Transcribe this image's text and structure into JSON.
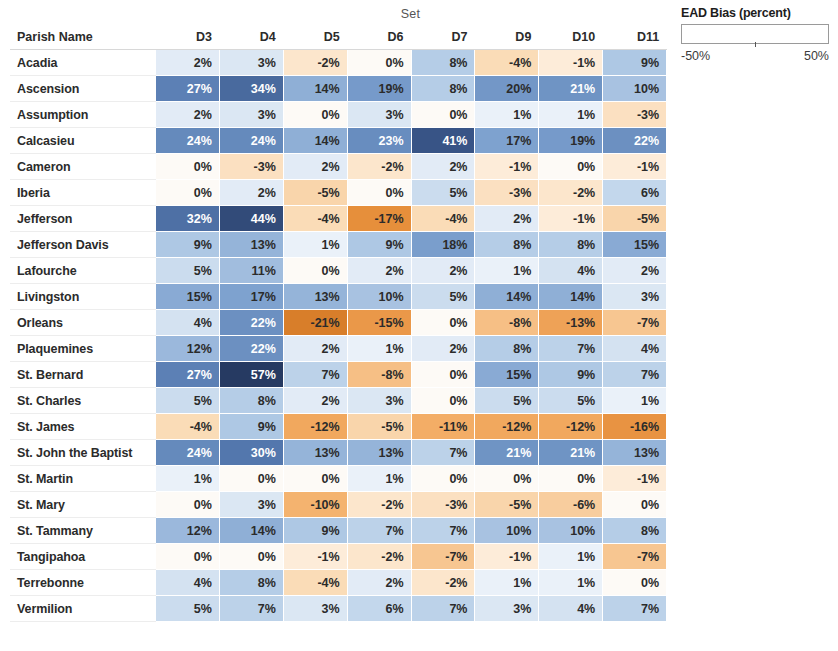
{
  "axis": {
    "column_group_title": "Set",
    "row_header": "Parish Name"
  },
  "legend": {
    "title": "EAD Bias (percent)",
    "min_label": "-50%",
    "max_label": "50%",
    "min_value": -50,
    "max_value": 50,
    "colors": {
      "negative_extreme": "#4a2910",
      "negative_mid": "#f0a75a",
      "neutral": "#fdf6ee",
      "positive_mid": "#7b9fd0",
      "positive_extreme": "#2b4570"
    }
  },
  "chart_data": {
    "type": "heatmap",
    "title": "EAD Bias (percent)",
    "xlabel": "Set",
    "ylabel": "Parish Name",
    "grid": false,
    "legend_position": "top-right",
    "value_suffix": "%",
    "zlim": [
      -50,
      50
    ],
    "categories": [
      "D3",
      "D4",
      "D5",
      "D6",
      "D7",
      "D9",
      "D10",
      "D11"
    ],
    "rows": [
      {
        "label": "Acadia",
        "values": [
          2,
          3,
          -2,
          0,
          8,
          -4,
          -1,
          9
        ]
      },
      {
        "label": "Ascension",
        "values": [
          27,
          34,
          14,
          19,
          8,
          20,
          21,
          10
        ]
      },
      {
        "label": "Assumption",
        "values": [
          2,
          3,
          0,
          3,
          0,
          1,
          1,
          -3
        ]
      },
      {
        "label": "Calcasieu",
        "values": [
          24,
          24,
          14,
          23,
          41,
          17,
          19,
          22
        ]
      },
      {
        "label": "Cameron",
        "values": [
          0,
          -3,
          2,
          -2,
          2,
          -1,
          0,
          -1
        ]
      },
      {
        "label": "Iberia",
        "values": [
          0,
          2,
          -5,
          0,
          5,
          -3,
          -2,
          6
        ]
      },
      {
        "label": "Jefferson",
        "values": [
          32,
          44,
          -4,
          -17,
          -4,
          2,
          -1,
          -5
        ]
      },
      {
        "label": "Jefferson Davis",
        "values": [
          9,
          13,
          1,
          9,
          18,
          8,
          8,
          15
        ]
      },
      {
        "label": "Lafourche",
        "values": [
          5,
          11,
          0,
          2,
          2,
          1,
          4,
          2
        ]
      },
      {
        "label": "Livingston",
        "values": [
          15,
          17,
          13,
          10,
          5,
          14,
          14,
          3
        ]
      },
      {
        "label": "Orleans",
        "values": [
          4,
          22,
          -21,
          -15,
          0,
          -8,
          -13,
          -7
        ]
      },
      {
        "label": "Plaquemines",
        "values": [
          12,
          22,
          2,
          1,
          2,
          8,
          7,
          4
        ]
      },
      {
        "label": "St. Bernard",
        "values": [
          27,
          57,
          7,
          -8,
          0,
          15,
          9,
          7
        ]
      },
      {
        "label": "St. Charles",
        "values": [
          5,
          8,
          2,
          3,
          0,
          5,
          5,
          1
        ]
      },
      {
        "label": "St. James",
        "values": [
          -4,
          9,
          -12,
          -5,
          -11,
          -12,
          -12,
          -16
        ]
      },
      {
        "label": "St. John the Baptist",
        "values": [
          24,
          30,
          13,
          13,
          7,
          21,
          21,
          13
        ]
      },
      {
        "label": "St. Martin",
        "values": [
          1,
          0,
          0,
          1,
          0,
          0,
          0,
          -1
        ]
      },
      {
        "label": "St. Mary",
        "values": [
          0,
          3,
          -10,
          -2,
          -3,
          -5,
          -6,
          0
        ]
      },
      {
        "label": "St. Tammany",
        "values": [
          12,
          14,
          9,
          7,
          7,
          10,
          10,
          8
        ]
      },
      {
        "label": "Tangipahoa",
        "values": [
          0,
          0,
          -1,
          -2,
          -7,
          -1,
          1,
          -7
        ]
      },
      {
        "label": "Terrebonne",
        "values": [
          4,
          8,
          -4,
          2,
          -2,
          1,
          1,
          0
        ]
      },
      {
        "label": "Vermilion",
        "values": [
          5,
          7,
          3,
          6,
          7,
          3,
          4,
          7
        ]
      }
    ]
  }
}
